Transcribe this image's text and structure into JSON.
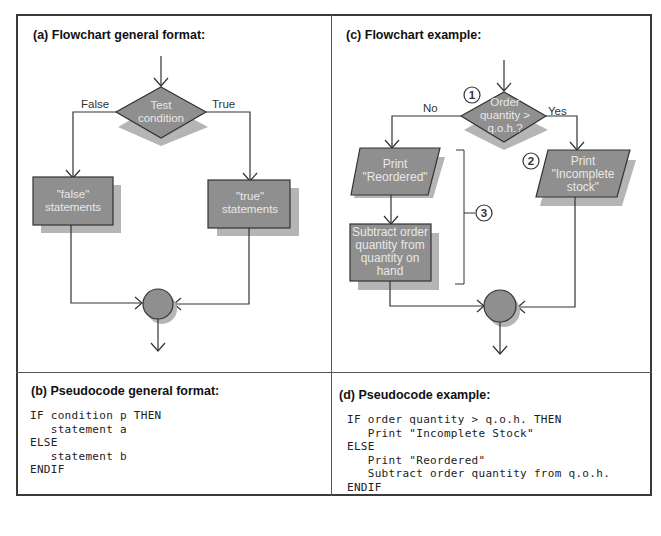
{
  "panels": {
    "a": {
      "title": "(a) Flowchart general format:",
      "decision": [
        "Test",
        "condition"
      ],
      "false_label": "False",
      "true_label": "True",
      "false_box": [
        "\"false\"",
        "statements"
      ],
      "true_box": [
        "\"true\"",
        "statements"
      ]
    },
    "b": {
      "title": "(b) Pseudocode general format:",
      "code": "IF condition p THEN\n   statement a\nELSE\n   statement b\nENDIF"
    },
    "c": {
      "title": "(c) Flowchart example:",
      "decision": [
        "Order",
        "quantity >",
        "q.o.h.?"
      ],
      "no_label": "No",
      "yes_label": "Yes",
      "marker_1": "1",
      "marker_2": "2",
      "marker_3": "3",
      "print_reordered": [
        "Print",
        "\"Reordered\""
      ],
      "print_incomplete": [
        "Print",
        "\"Incomplete",
        "stock\""
      ],
      "subtract_box": [
        "Subtract order",
        "quantity from",
        "quantity on",
        "hand"
      ]
    },
    "d": {
      "title": "(d) Pseudocode example:",
      "code": "IF order quantity > q.o.h. THEN\n   Print \"Incomplete Stock\"\nELSE\n   Print \"Reordered\"\n   Subtract order quantity from q.o.h.\nENDIF"
    }
  },
  "colors": {
    "shape_fill": "#8f8f8f",
    "shadow_fill": "#b5b5b5",
    "line": "#333333",
    "frame": "#3a3a3a"
  }
}
